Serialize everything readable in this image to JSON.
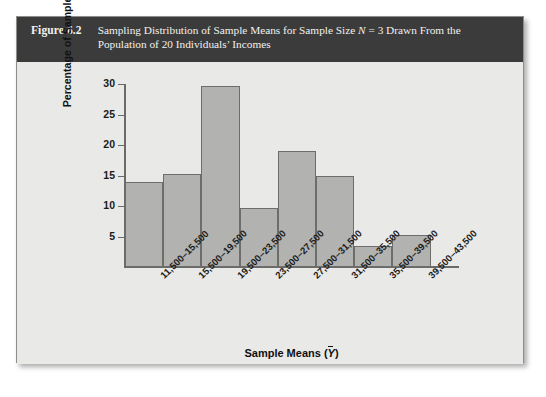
{
  "figure": {
    "label": "Figure 6.2",
    "caption_line1_part1": "Sampling Distribution of Sample Means for Sample Size ",
    "caption_n": "N",
    "caption_line1_part2": " = 3 Drawn From the",
    "caption_line2": "Population of 20 Individuals’ Incomes"
  },
  "colors": {
    "header_bg": "#3b3b3b",
    "header_text": "#f2f1ee",
    "panel_bg": "#e9e9e7",
    "bar_fill": "#b2b2b0",
    "bar_stroke": "#6d6d6b",
    "axis": "#6a6a68",
    "text": "#111111"
  },
  "chart_data": {
    "type": "bar",
    "title": "Sampling Distribution of Sample Means for Sample Size N = 3 Drawn From the Population of 20 Individuals’ Incomes",
    "xlabel": "Sample Means (Ȳ)",
    "ylabel": "Percentage of Samples",
    "categories": [
      "11,500–15,500",
      "15,500–19,500",
      "19,500–23,500",
      "23,500–27,500",
      "27,500–31,500",
      "31,500–35,500",
      "35,500–39,500",
      "39,500–43,500"
    ],
    "values": [
      14.0,
      15.2,
      29.7,
      9.6,
      19.0,
      15.0,
      3.5,
      5.2
    ],
    "ylim": [
      0,
      30
    ],
    "yticks": [
      5,
      10,
      15,
      20,
      25,
      30
    ],
    "ytick_labels": [
      "5",
      "10",
      "15",
      "20",
      "25",
      "30"
    ],
    "grid": false,
    "legend": false
  }
}
